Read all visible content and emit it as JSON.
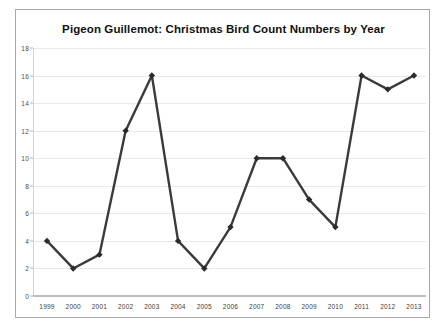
{
  "chart_data": {
    "type": "line",
    "title": "Pigeon Guillemot: Christmas Bird Count Numbers by Year",
    "xlabel": "",
    "ylabel": "",
    "categories": [
      "1999",
      "2000",
      "2001",
      "2002",
      "2003",
      "2004",
      "2005",
      "2006",
      "2007",
      "2008",
      "2009",
      "2010",
      "2011",
      "2012",
      "2013"
    ],
    "values": [
      4,
      2,
      3,
      12,
      16,
      4,
      2,
      5,
      10,
      10,
      7,
      5,
      16,
      15,
      16
    ],
    "series": [
      {
        "name": "Pigeon Guillemot count",
        "values": [
          4,
          2,
          3,
          12,
          16,
          4,
          2,
          5,
          10,
          10,
          7,
          5,
          16,
          15,
          16
        ]
      }
    ],
    "ylim": [
      0,
      18
    ],
    "ytick_step": 2,
    "yticks": [
      "0",
      "2",
      "4",
      "6",
      "8",
      "10",
      "12",
      "14",
      "16",
      "18"
    ],
    "grid": true,
    "legend": false,
    "legend_position": "none",
    "marker": "diamond",
    "colors": {
      "line": "#3b3b3b",
      "marker": "#2b2b2b",
      "grid": "#e9e9e9",
      "axis": "#bdbdbd",
      "border": "#a9a9a9",
      "title_text": "#111111",
      "tick_text": "#3d3d3d",
      "background": "#ffffff"
    }
  }
}
